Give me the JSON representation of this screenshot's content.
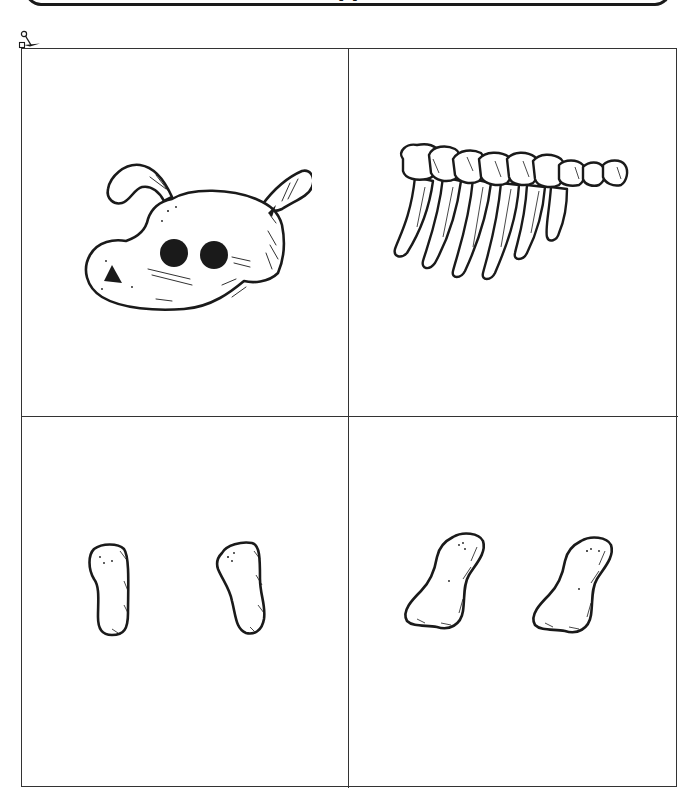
{
  "banner": {
    "title": "(   )"
  },
  "cut_guide": {
    "icon": "scissors-icon"
  },
  "pieces": [
    {
      "id": "head",
      "label": "Dog skull",
      "cell": "top-left"
    },
    {
      "id": "ribs",
      "label": "Rib cage",
      "cell": "top-right"
    },
    {
      "id": "front-legs",
      "label": "Front leg bones (2)",
      "cell": "bottom-left"
    },
    {
      "id": "back-legs",
      "label": "Back leg bones (2)",
      "cell": "bottom-right"
    }
  ],
  "colors": {
    "ink": "#1a1a1a",
    "grid_line": "#333333",
    "paper": "#ffffff"
  }
}
